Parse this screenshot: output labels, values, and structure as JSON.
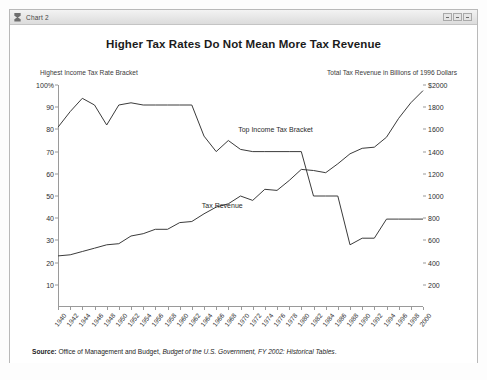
{
  "window": {
    "title": "Chart 2",
    "icon": "chart-window-icon",
    "controls": [
      "minimize",
      "maximize",
      "close"
    ]
  },
  "chart_data": {
    "type": "line",
    "title": "Higher Tax Rates Do Not Mean More Tax Revenue",
    "left_axis_caption": "Highest Income Tax Rate Bracket",
    "right_axis_caption": "Total Tax Revenue in Billions of 1996 Dollars",
    "xlabel": "",
    "ylabel": "",
    "grid": false,
    "legend_position": "inline-annotations",
    "left_ylim": [
      0,
      100
    ],
    "right_ylim": [
      0,
      2000
    ],
    "left_ticks": [
      "100%",
      "90",
      "80",
      "70",
      "60",
      "50",
      "40",
      "30",
      "20",
      "10"
    ],
    "left_tick_values": [
      100,
      90,
      80,
      70,
      60,
      50,
      40,
      30,
      20,
      10
    ],
    "right_ticks": [
      "$2000",
      "1800",
      "1600",
      "1400",
      "1200",
      "1000",
      "800",
      "600",
      "400",
      "200"
    ],
    "right_tick_values": [
      2000,
      1800,
      1600,
      1400,
      1200,
      1000,
      800,
      600,
      400,
      200
    ],
    "x": [
      1940,
      1942,
      1944,
      1946,
      1948,
      1950,
      1952,
      1954,
      1956,
      1958,
      1960,
      1962,
      1964,
      1966,
      1968,
      1970,
      1972,
      1974,
      1976,
      1978,
      1980,
      1982,
      1984,
      1986,
      1988,
      1990,
      1992,
      1994,
      1996,
      1998,
      2000
    ],
    "xtick_labels": [
      "1940",
      "1942",
      "1944",
      "1946",
      "1948",
      "1950",
      "1952",
      "1954",
      "1956",
      "1958",
      "1960",
      "1962",
      "1964",
      "1966",
      "1968",
      "1970",
      "1972",
      "1974",
      "1976",
      "1978",
      "1980",
      "1982",
      "1984",
      "1986",
      "1988",
      "1990",
      "1992",
      "1994",
      "1996",
      "1998",
      "2000"
    ],
    "series": [
      {
        "name": "Top Income Tax Bracket",
        "axis": "left",
        "units": "percent",
        "annotation": "Top Income Tax Bracket",
        "values": [
          81,
          88,
          94,
          91,
          82,
          91,
          92,
          91,
          91,
          91,
          91,
          91,
          77,
          70,
          75,
          71,
          70,
          70,
          70,
          70,
          70,
          50,
          50,
          50,
          28,
          31,
          31,
          39.6,
          39.6,
          39.6,
          39.6
        ]
      },
      {
        "name": "Tax Revenue",
        "axis": "right",
        "units": "billions of 1996 dollars",
        "annotation": "Tax Revenue",
        "values": [
          460,
          470,
          500,
          530,
          560,
          570,
          640,
          660,
          700,
          700,
          760,
          770,
          840,
          900,
          930,
          1000,
          960,
          1060,
          1050,
          1140,
          1240,
          1230,
          1210,
          1290,
          1380,
          1430,
          1440,
          1530,
          1700,
          1840,
          1950
        ]
      }
    ]
  },
  "source": {
    "label": "Source:",
    "text_plain": " Office of Management and Budget, ",
    "text_italic": "Budget of the U.S. Government, FY 2002: Historical Tables",
    "text_end": "."
  }
}
